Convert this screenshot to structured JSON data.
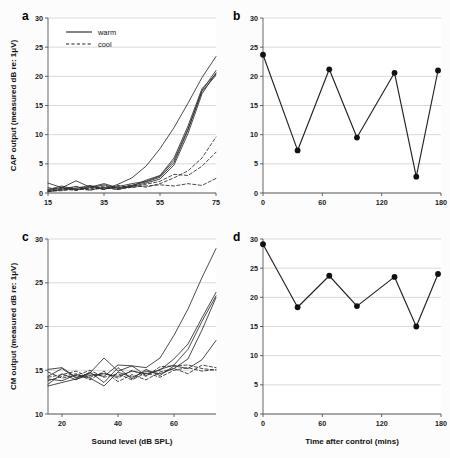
{
  "figure": {
    "background": "#fcfcfc",
    "ink_color": "#222222",
    "grid_color": "#c9c9c9"
  },
  "chart_data": [
    {
      "id": "a",
      "panel_label": "a",
      "type": "line",
      "title": "",
      "xlabel": "",
      "ylabel": "CAP output (measured dB re: 1μV)",
      "xlim": [
        15,
        75
      ],
      "ylim": [
        0,
        30
      ],
      "xticks": [
        15,
        35,
        55,
        75
      ],
      "yticks": [
        0,
        5,
        10,
        15,
        20,
        25,
        30
      ],
      "grid": true,
      "legend": {
        "position": "top-left",
        "entries": [
          {
            "label": "warm",
            "style": "solid"
          },
          {
            "label": "cool",
            "style": "dashed"
          }
        ]
      },
      "x": [
        15,
        20,
        25,
        30,
        35,
        40,
        45,
        50,
        55,
        60,
        65,
        70,
        75
      ],
      "series": [
        {
          "name": "warm-1",
          "style": "solid",
          "values": [
            0.4,
            1.0,
            0.5,
            1.2,
            0.6,
            1.5,
            2.6,
            4.6,
            7.6,
            11.2,
            15.4,
            19.8,
            23.4
          ]
        },
        {
          "name": "warm-2",
          "style": "solid",
          "values": [
            1.7,
            0.9,
            2.1,
            1.0,
            1.6,
            0.9,
            1.3,
            1.9,
            2.7,
            5.2,
            10.8,
            17.6,
            21.0
          ]
        },
        {
          "name": "warm-3",
          "style": "solid",
          "values": [
            0.2,
            0.7,
            1.1,
            0.5,
            1.0,
            0.6,
            1.2,
            2.2,
            3.0,
            6.0,
            11.5,
            17.9,
            20.4
          ]
        },
        {
          "name": "warm-4",
          "style": "solid",
          "values": [
            0.3,
            0.5,
            0.8,
            1.3,
            0.7,
            1.1,
            1.6,
            2.0,
            2.9,
            5.6,
            11.0,
            17.4,
            20.2
          ]
        },
        {
          "name": "warm-5",
          "style": "solid",
          "values": [
            0.6,
            1.2,
            0.6,
            0.9,
            1.4,
            0.8,
            1.1,
            1.7,
            2.4,
            4.8,
            10.2,
            17.0,
            20.6
          ]
        },
        {
          "name": "cool-1",
          "style": "dashed",
          "values": [
            0.9,
            0.6,
            1.1,
            0.7,
            1.2,
            0.8,
            1.4,
            1.0,
            1.6,
            2.6,
            3.8,
            6.0,
            9.6
          ]
        },
        {
          "name": "cool-2",
          "style": "dashed",
          "values": [
            0.5,
            0.8,
            0.4,
            1.0,
            0.6,
            1.3,
            0.9,
            1.5,
            2.0,
            3.2,
            3.0,
            4.6,
            7.0
          ]
        },
        {
          "name": "cool-3",
          "style": "dashed",
          "values": [
            0.3,
            0.4,
            0.7,
            0.5,
            0.9,
            0.6,
            1.0,
            1.2,
            1.4,
            1.2,
            1.6,
            1.3,
            2.5
          ]
        }
      ]
    },
    {
      "id": "b",
      "panel_label": "b",
      "type": "line",
      "title": "",
      "xlabel": "",
      "ylabel": "",
      "xlim": [
        0,
        180
      ],
      "ylim": [
        0,
        30
      ],
      "xticks": [
        0,
        60,
        120,
        180
      ],
      "yticks": [
        0,
        5,
        10,
        15,
        20,
        25,
        30
      ],
      "grid": true,
      "marker": "filled-circle",
      "x": [
        0,
        35,
        67,
        95,
        133,
        155,
        177
      ],
      "values": [
        23.7,
        7.3,
        21.2,
        9.5,
        20.6,
        2.8,
        21.0
      ]
    },
    {
      "id": "c",
      "panel_label": "c",
      "type": "line",
      "title": "",
      "xlabel": "Sound level (dB SPL)",
      "ylabel": "CM output (measured dB re: 1μV)",
      "xlim": [
        15,
        75
      ],
      "ylim": [
        10,
        30
      ],
      "xticks": [
        20,
        40,
        60
      ],
      "yticks": [
        10,
        15,
        20,
        25,
        30
      ],
      "grid": true,
      "x": [
        15,
        20,
        25,
        30,
        35,
        40,
        45,
        50,
        55,
        60,
        65,
        70,
        75
      ],
      "series": [
        {
          "name": "warm-1",
          "style": "solid",
          "values": [
            15.1,
            15.3,
            14.2,
            14.6,
            14.3,
            15.6,
            15.5,
            15.3,
            16.4,
            19.0,
            22.0,
            25.6,
            28.9
          ]
        },
        {
          "name": "warm-2",
          "style": "solid",
          "values": [
            13.2,
            13.6,
            14.0,
            14.4,
            14.6,
            14.3,
            14.9,
            14.6,
            15.0,
            16.3,
            18.0,
            21.0,
            23.9
          ]
        },
        {
          "name": "warm-3",
          "style": "solid",
          "values": [
            14.3,
            15.2,
            14.1,
            14.7,
            16.4,
            14.9,
            15.5,
            14.4,
            15.1,
            15.6,
            17.4,
            20.6,
            23.5
          ]
        },
        {
          "name": "warm-4",
          "style": "solid",
          "values": [
            14.0,
            13.8,
            14.5,
            14.1,
            13.2,
            14.8,
            14.2,
            14.9,
            14.6,
            15.2,
            16.3,
            19.6,
            23.3
          ]
        },
        {
          "name": "warm-5",
          "style": "solid",
          "values": [
            13.4,
            14.6,
            13.9,
            14.8,
            13.6,
            15.3,
            14.0,
            15.1,
            14.4,
            15.5,
            15.2,
            16.2,
            18.4
          ]
        },
        {
          "name": "cool-1",
          "style": "dashed",
          "values": [
            14.2,
            14.5,
            14.9,
            14.2,
            14.7,
            14.1,
            15.0,
            14.3,
            15.4,
            15.5,
            15.6,
            15.2,
            15.0
          ]
        },
        {
          "name": "cool-2",
          "style": "dashed",
          "values": [
            14.8,
            14.1,
            14.4,
            15.0,
            14.2,
            14.6,
            13.9,
            14.7,
            14.2,
            15.0,
            15.3,
            14.9,
            15.1
          ]
        },
        {
          "name": "cool-3",
          "style": "dashed",
          "values": [
            13.8,
            14.3,
            14.6,
            13.9,
            14.9,
            13.7,
            14.5,
            13.9,
            14.8,
            15.2,
            14.6,
            15.6,
            15.3
          ]
        }
      ]
    },
    {
      "id": "d",
      "panel_label": "d",
      "type": "line",
      "title": "",
      "xlabel": "Time after control (mins)",
      "ylabel": "",
      "xlim": [
        0,
        180
      ],
      "ylim": [
        0,
        30
      ],
      "xticks": [
        0,
        60,
        120,
        180
      ],
      "yticks": [
        0,
        5,
        10,
        15,
        20,
        25,
        30
      ],
      "grid": true,
      "marker": "filled-circle",
      "x": [
        0,
        35,
        67,
        95,
        133,
        155,
        177
      ],
      "values": [
        29.1,
        18.3,
        23.7,
        18.5,
        23.5,
        15.0,
        24.0
      ]
    }
  ]
}
